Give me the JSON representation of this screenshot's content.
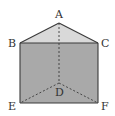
{
  "diagram": {
    "type": "triangular-prism",
    "colors": {
      "background": "#ffffff",
      "front_face": "#a9a9a9",
      "top_face": "#d9d9d9",
      "edge": "#3a3a3a",
      "hidden_edge": "#3a3a3a",
      "label": "#333333"
    },
    "vertices": {
      "A": {
        "label": "A",
        "x": 59,
        "y": 23
      },
      "B": {
        "label": "B",
        "x": 20,
        "y": 43
      },
      "C": {
        "label": "C",
        "x": 98,
        "y": 43
      },
      "D": {
        "label": "D",
        "x": 59,
        "y": 83
      },
      "E": {
        "label": "E",
        "x": 20,
        "y": 103
      },
      "F": {
        "label": "F",
        "x": 98,
        "y": 103
      }
    },
    "solid_edges": [
      "AB",
      "AC",
      "BC",
      "BE",
      "CF",
      "EF"
    ],
    "hidden_edges": [
      "AD",
      "DE",
      "DF"
    ]
  }
}
